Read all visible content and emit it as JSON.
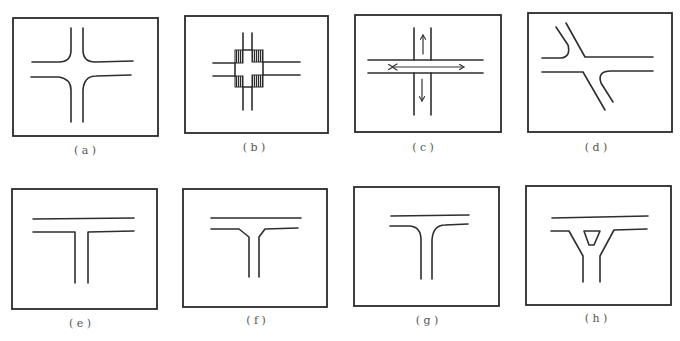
{
  "figure": {
    "stroke_color": "#2e2e2e",
    "panels": [
      {
        "id": "a",
        "label": "( a )",
        "type": "four-way intersection with rounded corners"
      },
      {
        "id": "b",
        "label": "( b )",
        "type": "four-way intersection with hatched corner zones"
      },
      {
        "id": "c",
        "label": "( c )",
        "type": "four-way crossing with direction arrows"
      },
      {
        "id": "d",
        "label": "( d )",
        "type": "skewed four-way intersection"
      },
      {
        "id": "e",
        "label": "( e )",
        "type": "T-intersection with square corners"
      },
      {
        "id": "f",
        "label": "( f )",
        "type": "T-intersection with flared corners"
      },
      {
        "id": "g",
        "label": "( g )",
        "type": "T-intersection with rounded corners"
      },
      {
        "id": "h",
        "label": "( h )",
        "type": "channelized T-intersection with traffic island"
      }
    ]
  }
}
